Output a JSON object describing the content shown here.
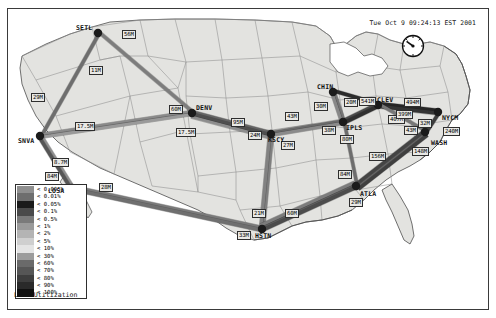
{
  "window": {
    "timestamp": "Tue Oct  9 09:24:13 EST 2001",
    "background": "#ffffff",
    "border_color": "#3a3a3a"
  },
  "icons": {
    "gauge": "speedometer-gauge-icon"
  },
  "legend": {
    "title": "Line Utilization",
    "entries": [
      {
        "label": "< 0.005%",
        "color": "#8f8f8f"
      },
      {
        "label": "< 0.01%",
        "color": "#6e6e6e"
      },
      {
        "label": "< 0.05%",
        "color": "#1a1a1a"
      },
      {
        "label": "< 0.1%",
        "color": "#4a4a4a"
      },
      {
        "label": "< 0.5%",
        "color": "#7a7a7a"
      },
      {
        "label": "< 1%",
        "color": "#9a9a9a"
      },
      {
        "label": "< 2%",
        "color": "#b4b4b4"
      },
      {
        "label": "< 5%",
        "color": "#cfcfcf"
      },
      {
        "label": "< 10%",
        "color": "#e4e4e4"
      },
      {
        "label": "< 30%",
        "color": "#9c9c9c"
      },
      {
        "label": "< 60%",
        "color": "#6a6a6a"
      },
      {
        "label": "< 70%",
        "color": "#565656"
      },
      {
        "label": "< 80%",
        "color": "#3e3e3e"
      },
      {
        "label": "< 90%",
        "color": "#2a2a2a"
      },
      {
        "label": "< 100%",
        "color": "#101010"
      }
    ]
  },
  "map": {
    "land_fill": "#e3e3e0",
    "state_stroke": "#8d8d8d",
    "coast_stroke": "#4d4d4d",
    "node_color": "#1b1b1b"
  },
  "nodes": [
    {
      "id": "SETL",
      "label": "SETL",
      "x": 98,
      "y": 33,
      "label_dx": -22,
      "label_dy": -9
    },
    {
      "id": "SNVA",
      "label": "SNVA",
      "x": 40,
      "y": 136,
      "label_dx": -22,
      "label_dy": 1
    },
    {
      "id": "LOSA",
      "label": "LOSA",
      "x": 72,
      "y": 188,
      "label_dx": -24,
      "label_dy": -1
    },
    {
      "id": "DENV",
      "label": "DENV",
      "x": 192,
      "y": 113,
      "label_dx": 4,
      "label_dy": -9
    },
    {
      "id": "KSCY",
      "label": "KSCY",
      "x": 271,
      "y": 134,
      "label_dx": -3,
      "label_dy": 2
    },
    {
      "id": "HSTN",
      "label": "HSTN",
      "x": 262,
      "y": 229,
      "label_dx": -7,
      "label_dy": 3
    },
    {
      "id": "CHIN",
      "label": "CHIN",
      "x": 333,
      "y": 92,
      "label_dx": -16,
      "label_dy": -9
    },
    {
      "id": "IPLS",
      "label": "IPLS",
      "x": 343,
      "y": 122,
      "label_dx": 3,
      "label_dy": 2
    },
    {
      "id": "CLEV",
      "label": "CLEV",
      "x": 378,
      "y": 105,
      "label_dx": -1,
      "label_dy": -9
    },
    {
      "id": "ATLA",
      "label": "ATLA",
      "x": 356,
      "y": 186,
      "label_dx": 4,
      "label_dy": 4
    },
    {
      "id": "NYCM",
      "label": "NYCM",
      "x": 438,
      "y": 112,
      "label_dx": 4,
      "label_dy": 2
    },
    {
      "id": "WASH",
      "label": "WASH",
      "x": 425,
      "y": 132,
      "label_dx": 6,
      "label_dy": 7
    }
  ],
  "links": [
    {
      "from": "SETL",
      "to": "SNVA",
      "label": "11M",
      "lx": 89,
      "ly": 66,
      "color": "#6e6e6e",
      "w": 3.4
    },
    {
      "from": "SETL",
      "to": "DENV",
      "label": "56M",
      "lx": 122,
      "ly": 30,
      "color": "#7d7d7d",
      "w": 3.2
    },
    {
      "from": "SNVA",
      "to": "DENV",
      "label": "29M",
      "lx": 31,
      "ly": 93,
      "color": "#8a8a8a",
      "w": 3.0
    },
    {
      "from": "SNVA",
      "to": "DENV",
      "label": "17.5M",
      "lx": 75,
      "ly": 122,
      "color": "#9a9a9a",
      "w": 2.8
    },
    {
      "from": "SNVA",
      "to": "LOSA",
      "label": "8.7M",
      "lx": 52,
      "ly": 158,
      "color": "#8e8e8e",
      "w": 3.0
    },
    {
      "from": "SNVA",
      "to": "LOSA",
      "label": "84M",
      "lx": 45,
      "ly": 172,
      "color": "#555555",
      "w": 3.4
    },
    {
      "from": "LOSA",
      "to": "HSTN",
      "label": "28M",
      "lx": 99,
      "ly": 183,
      "color": "#7a7a7a",
      "w": 3.6
    },
    {
      "from": "LOSA",
      "to": "HSTN",
      "label": "33M",
      "lx": 237,
      "ly": 231,
      "color": "#6f6f6f",
      "w": 3.4
    },
    {
      "from": "DENV",
      "to": "KSCY",
      "label": "60M",
      "lx": 169,
      "ly": 105,
      "color": "#656565",
      "w": 3.2
    },
    {
      "from": "DENV",
      "to": "KSCY",
      "label": "95M",
      "lx": 231,
      "ly": 118,
      "color": "#4f4f4f",
      "w": 3.4
    },
    {
      "from": "DENV",
      "to": "KSCY",
      "label": "17.5M",
      "lx": 176,
      "ly": 128,
      "color": "#8d8d8d",
      "w": 2.8
    },
    {
      "from": "KSCY",
      "to": "IPLS",
      "label": "43M",
      "lx": 285,
      "ly": 112,
      "color": "#6a6a6a",
      "w": 3.2
    },
    {
      "from": "KSCY",
      "to": "IPLS",
      "label": "27M",
      "lx": 281,
      "ly": 141,
      "color": "#8a8a8a",
      "w": 3.0
    },
    {
      "from": "KSCY",
      "to": "HSTN",
      "label": "24M",
      "lx": 248,
      "ly": 131,
      "color": "#7f7f7f",
      "w": 3.2
    },
    {
      "from": "KSCY",
      "to": "HSTN",
      "label": "21M",
      "lx": 252,
      "ly": 209,
      "color": "#828282",
      "w": 3.2
    },
    {
      "from": "HSTN",
      "to": "ATLA",
      "label": "60M",
      "lx": 285,
      "ly": 209,
      "color": "#5e5e5e",
      "w": 3.4
    },
    {
      "from": "HSTN",
      "to": "ATLA",
      "label": "84M",
      "lx": 338,
      "ly": 170,
      "color": "#4c4c4c",
      "w": 3.4
    },
    {
      "from": "CHIN",
      "to": "IPLS",
      "label": "30M",
      "lx": 314,
      "ly": 102,
      "color": "#757575",
      "w": 3.0
    },
    {
      "from": "CHIN",
      "to": "IPLS",
      "label": "20M",
      "lx": 344,
      "ly": 98,
      "color": "#888888",
      "w": 3.0
    },
    {
      "from": "CHIN",
      "to": "CLEV",
      "label": "541M",
      "lx": 359,
      "ly": 97,
      "color": "#2b2b2b",
      "w": 3.8
    },
    {
      "from": "IPLS",
      "to": "ATLA",
      "label": "38M",
      "lx": 322,
      "ly": 126,
      "color": "#6d6d6d",
      "w": 3.2
    },
    {
      "from": "IPLS",
      "to": "CLEV",
      "label": "80M",
      "lx": 340,
      "ly": 135,
      "color": "#4a4a4a",
      "w": 3.2
    },
    {
      "from": "IPLS",
      "to": "CLEV",
      "label": "407M",
      "lx": 388,
      "ly": 115,
      "color": "#303030",
      "w": 3.6
    },
    {
      "from": "CLEV",
      "to": "NYCM",
      "label": "494M",
      "lx": 404,
      "ly": 98,
      "color": "#262626",
      "w": 3.8
    },
    {
      "from": "CLEV",
      "to": "NYCM",
      "label": "399M",
      "lx": 396,
      "ly": 110,
      "color": "#343434",
      "w": 3.6
    },
    {
      "from": "CLEV",
      "to": "WASH",
      "label": "32M",
      "lx": 418,
      "ly": 119,
      "color": "#777777",
      "w": 3.0
    },
    {
      "from": "NYCM",
      "to": "WASH",
      "label": "240M",
      "lx": 443,
      "ly": 127,
      "color": "#3d3d3d",
      "w": 3.4
    },
    {
      "from": "WASH",
      "to": "ATLA",
      "label": "43M",
      "lx": 404,
      "ly": 126,
      "color": "#6b6b6b",
      "w": 3.2
    },
    {
      "from": "WASH",
      "to": "ATLA",
      "label": "148M",
      "lx": 412,
      "ly": 147,
      "color": "#444444",
      "w": 3.4
    },
    {
      "from": "ATLA",
      "to": "WASH",
      "label": "156M",
      "lx": 369,
      "ly": 152,
      "color": "#3f3f3f",
      "w": 3.4
    },
    {
      "from": "ATLA",
      "to": "HSTN",
      "label": "29M",
      "lx": 349,
      "ly": 198,
      "color": "#7c7c7c",
      "w": 3.0
    }
  ]
}
